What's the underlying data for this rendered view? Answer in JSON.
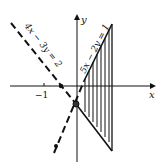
{
  "diagram": {
    "axes": {
      "x_label": "x",
      "y_label": "y",
      "tick_labels": [
        "−1"
      ]
    },
    "lines": [
      {
        "equation": "4x − 3y = 2",
        "style": "dashed"
      },
      {
        "equation": "5x − 2y = 1",
        "style": "dashed-then-solid"
      }
    ],
    "region": {
      "fill": "vertical-hatch",
      "description": "triangular region right of y-axis bounded by two lines and vertical edge"
    },
    "colors": {
      "ink": "#111111",
      "background": "#ffffff"
    }
  }
}
